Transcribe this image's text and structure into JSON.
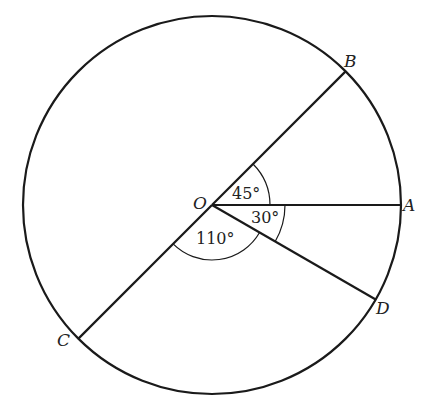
{
  "diagram": {
    "type": "circle-with-radii",
    "center": {
      "label": "O",
      "x": 212,
      "y": 205
    },
    "radius": 189,
    "points": [
      {
        "label": "A",
        "angle_deg": 0
      },
      {
        "label": "B",
        "angle_deg": 45
      },
      {
        "label": "D",
        "angle_deg": -30
      },
      {
        "label": "C",
        "angle_deg": 225
      }
    ],
    "angles": [
      {
        "label": "45°",
        "between": [
          "A",
          "B"
        ]
      },
      {
        "label": "30°",
        "between": [
          "A",
          "D"
        ]
      },
      {
        "label": "110°",
        "between": [
          "D",
          "C"
        ]
      }
    ],
    "labels": {
      "O": "O",
      "A": "A",
      "B": "B",
      "C": "C",
      "D": "D",
      "angle_AOB": "45°",
      "angle_AOD": "30°",
      "angle_DOC": "110°"
    },
    "colors": {
      "stroke": "#1a1a1a",
      "background": "#ffffff"
    }
  }
}
